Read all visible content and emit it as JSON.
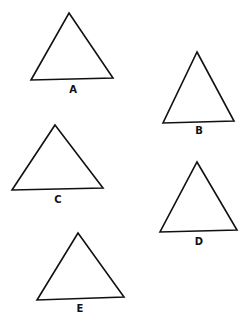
{
  "diagram": {
    "background": "#ffffff",
    "stroke_color": "#111111",
    "figures": [
      {
        "label": "A",
        "apex": [
          69,
          13
        ],
        "bottom_left": [
          31,
          80
        ],
        "bottom_right": [
          113,
          78
        ],
        "label_pos": [
          73,
          93
        ]
      },
      {
        "label": "B",
        "apex": [
          197,
          52
        ],
        "bottom_left": [
          163,
          123
        ],
        "bottom_right": [
          234,
          121
        ],
        "label_pos": [
          199,
          134
        ]
      },
      {
        "label": "C",
        "apex": [
          55,
          125
        ],
        "bottom_left": [
          12,
          190
        ],
        "bottom_right": [
          103,
          188
        ],
        "label_pos": [
          58,
          203
        ]
      },
      {
        "label": "D",
        "apex": [
          197,
          162
        ],
        "bottom_left": [
          160,
          232
        ],
        "bottom_right": [
          237,
          230
        ],
        "label_pos": [
          199,
          245
        ]
      },
      {
        "label": "E",
        "apex": [
          78,
          233
        ],
        "bottom_left": [
          37,
          300
        ],
        "bottom_right": [
          124,
          297
        ],
        "label_pos": [
          80,
          312
        ]
      }
    ]
  }
}
